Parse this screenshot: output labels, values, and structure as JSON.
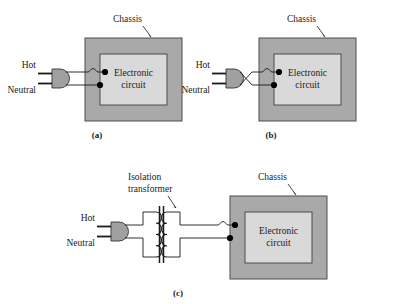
{
  "figure": {
    "background_color": "#ffffff",
    "panels": [
      {
        "id": "a",
        "panel_label": "(a)",
        "chassis_label": "Chassis",
        "circuit_label_line1": "Electronic",
        "circuit_label_line2": "circuit",
        "hot_label": "Hot",
        "neutral_label": "Neutral",
        "wiring": "hot-and-neutral-direct-with-hop"
      },
      {
        "id": "b",
        "panel_label": "(b)",
        "chassis_label": "Chassis",
        "circuit_label_line1": "Electronic",
        "circuit_label_line2": "circuit",
        "hot_label": "Hot",
        "neutral_label": "Neutral",
        "wiring": "hot-and-neutral-crossed-reversed-polarity"
      },
      {
        "id": "c",
        "panel_label": "(c)",
        "chassis_label": "Chassis",
        "circuit_label_line1": "Electronic",
        "circuit_label_line2": "circuit",
        "hot_label": "Hot",
        "neutral_label": "Neutral",
        "transformer_label_line1": "Isolation",
        "transformer_label_line2": "transformer",
        "wiring": "hot-and-neutral-through-isolation-transformer"
      }
    ]
  },
  "colors": {
    "chassis_fill": "#a9a9a9",
    "chassis_stroke": "#4d4d4d",
    "circuit_fill": "#d9d9d9",
    "circuit_stroke": "#4d4d4d",
    "plug_fill": "#a0a0a0",
    "plug_stroke": "#333333",
    "wire_stroke": "#1a1a1a",
    "dot_fill": "#000000",
    "text_color": "#1a1a1a",
    "coil_stroke": "#1a1a1a",
    "core_stroke": "#1a1a1a"
  }
}
